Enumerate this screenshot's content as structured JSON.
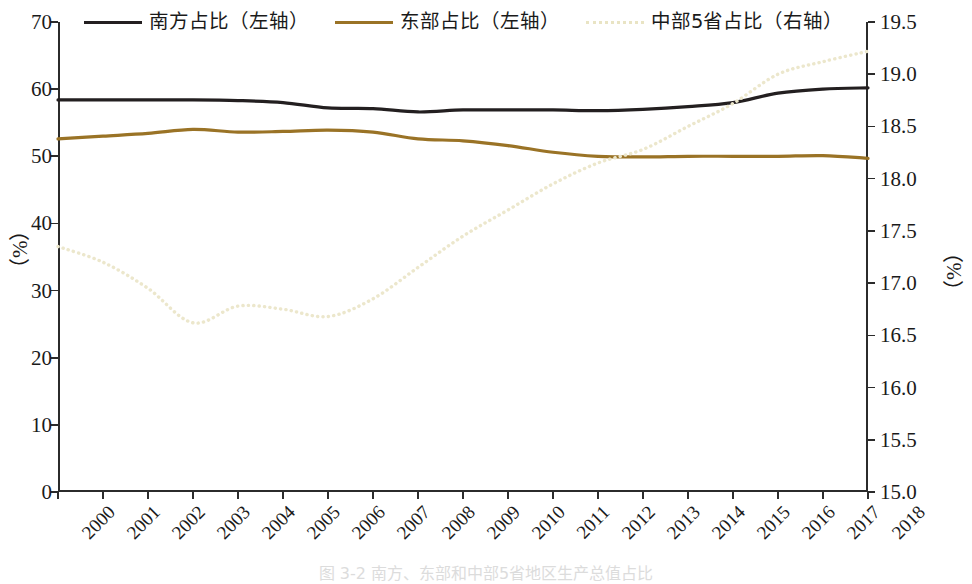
{
  "legend": {
    "position": "top",
    "items": [
      {
        "label": "南方占比（左轴）",
        "color": "#231f20",
        "style": "solid",
        "axis": "left"
      },
      {
        "label": "东部占比（左轴）",
        "color": "#9a7326",
        "style": "solid",
        "axis": "left"
      },
      {
        "label": "中部5省占比（右轴）",
        "color": "#f2efdc",
        "style": "dotted",
        "axis": "right"
      }
    ]
  },
  "axes": {
    "left": {
      "title": "（%）",
      "ticks": [
        0,
        10,
        20,
        30,
        40,
        50,
        60,
        70
      ],
      "tick_labels": [
        "0",
        "10",
        "20",
        "30",
        "40",
        "50",
        "60",
        "70"
      ],
      "min": 0,
      "max": 70
    },
    "right": {
      "title": "（%）",
      "ticks": [
        15.0,
        15.5,
        16.0,
        16.5,
        17.0,
        17.5,
        18.0,
        18.5,
        19.0,
        19.5
      ],
      "tick_labels": [
        "15.0",
        "15.5",
        "16.0",
        "16.5",
        "17.0",
        "17.5",
        "18.0",
        "18.5",
        "19.0",
        "19.5"
      ],
      "min": 15.0,
      "max": 19.5
    }
  },
  "caption": "图 3-2  南方、东部和中部5省地区生产总值占比",
  "chart_data": {
    "type": "line",
    "title": "",
    "xlabel": "",
    "ylabel": "（%）",
    "grid": false,
    "legend_position": "top",
    "x": [
      2000,
      2001,
      2002,
      2003,
      2004,
      2005,
      2006,
      2007,
      2008,
      2009,
      2010,
      2011,
      2012,
      2013,
      2014,
      2015,
      2016,
      2017,
      2018
    ],
    "categories": [
      "2000",
      "2001",
      "2002",
      "2003",
      "2004",
      "2005",
      "2006",
      "2007",
      "2008",
      "2009",
      "2010",
      "2011",
      "2012",
      "2013",
      "2014",
      "2015",
      "2016",
      "2017",
      "2018"
    ],
    "ylim": [
      0,
      70
    ],
    "y2lim": [
      15.0,
      19.5
    ],
    "series": [
      {
        "name": "南方占比（左轴）",
        "axis": "left",
        "color": "#231f20",
        "style": "solid",
        "values": [
          58.4,
          58.4,
          58.4,
          58.4,
          58.3,
          58.0,
          57.2,
          57.1,
          56.6,
          56.9,
          56.9,
          56.9,
          56.8,
          57.0,
          57.4,
          58.0,
          59.4,
          60.0,
          60.2
        ]
      },
      {
        "name": "东部占比（左轴）",
        "axis": "left",
        "color": "#9a7326",
        "style": "solid",
        "values": [
          52.6,
          53.0,
          53.4,
          54.0,
          53.6,
          53.7,
          53.9,
          53.6,
          52.6,
          52.3,
          51.6,
          50.6,
          50.0,
          49.9,
          50.0,
          50.0,
          50.0,
          50.1,
          49.7
        ]
      },
      {
        "name": "中部5省占比（右轴）",
        "axis": "right",
        "color": "#f2efdc",
        "style": "dotted",
        "values": [
          17.35,
          17.2,
          16.95,
          16.62,
          16.78,
          16.75,
          16.68,
          16.85,
          17.15,
          17.45,
          17.7,
          17.95,
          18.15,
          18.28,
          18.5,
          18.72,
          19.0,
          19.12,
          19.22
        ]
      }
    ]
  }
}
